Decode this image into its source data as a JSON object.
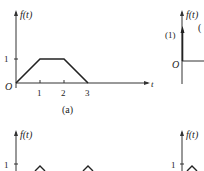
{
  "figure": {
    "panel_a": {
      "y_axis_label": "f(t)",
      "x_axis_label": "t",
      "origin_label": "O",
      "y_tick": "1",
      "x_ticks": [
        "1",
        "2",
        "3"
      ],
      "caption": "(a)",
      "points": [
        [
          0,
          0
        ],
        [
          1,
          1
        ],
        [
          2,
          1
        ],
        [
          3,
          0
        ]
      ]
    },
    "panel_b": {
      "y_axis_label": "f(t)",
      "origin_label": "O",
      "impulse_label": "(1)",
      "partial_label": "("
    },
    "panel_c": {
      "y_axis_label": "f(t)",
      "y_tick": "1"
    },
    "panel_d": {
      "y_axis_label": "f(t)",
      "y_tick": "1"
    }
  }
}
